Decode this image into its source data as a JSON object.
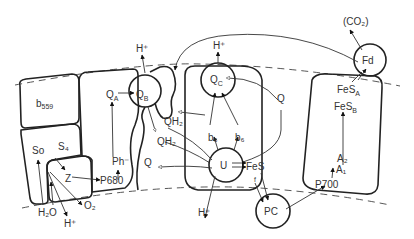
{
  "diagram": {
    "type": "photosynthetic electron transport schematic (thylakoid membrane)",
    "labels": {
      "co2": "(CO₂)",
      "fd": "Fd",
      "fesa": "FeS",
      "fesa_sub": "A",
      "fesb": "FeS",
      "fesb_sub": "B",
      "a2": "A₂",
      "a1": "A₁",
      "p700": "P700",
      "pc": "PC",
      "h_top_left": "H⁺",
      "h_top_mid": "H⁺",
      "qa": "Q",
      "qa_sub": "A",
      "qb": "Q",
      "qb_sub": "B",
      "qc": "Q",
      "qc_sub": "C",
      "q_right": "Q",
      "q_left": "Q",
      "qh2_1": "QH₂",
      "qh2_2": "QH₂",
      "b6_left": "b₆",
      "b6_right": "b₆",
      "u": "U",
      "fes": "FeS",
      "f": "f",
      "b559": "b",
      "b559_sub": "559",
      "s0": "So",
      "s4": "S₄",
      "z": "Z",
      "ph": "Ph⁻",
      "p680": "P680",
      "h2o": "H₂O",
      "o2": "O₂",
      "h_bottom_left": "H⁺",
      "h_bottom_mid": "H⁺"
    }
  }
}
